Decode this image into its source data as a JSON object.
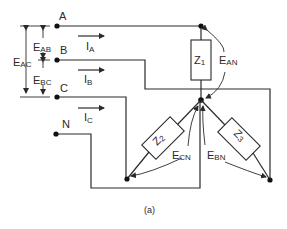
{
  "figure": {
    "caption": "(a)",
    "terminals": {
      "a": "A",
      "b": "B",
      "c": "C",
      "n": "N"
    },
    "currents": {
      "ia_main": "I",
      "ia_sub": "A",
      "ib_main": "I",
      "ib_sub": "B",
      "ic_main": "I",
      "ic_sub": "C"
    },
    "line_voltages": {
      "eab_main": "E",
      "eab_sub": "AB",
      "ebc_main": "E",
      "ebc_sub": "BC",
      "eac_main": "E",
      "eac_sub": "AC"
    },
    "phase_voltages": {
      "ean_main": "E",
      "ean_sub": "AN",
      "ecn_main": "E",
      "ecn_sub": "CN",
      "ebn_main": "E",
      "ebn_sub": "BN"
    },
    "impedances": {
      "z1_main": "Z",
      "z1_sub": "1",
      "z2_main": "Z",
      "z2_sub": "2",
      "z3_main": "Z",
      "z3_sub": "3"
    },
    "colors": {
      "line": "#2a2a2a",
      "background": "#ffffff"
    }
  }
}
